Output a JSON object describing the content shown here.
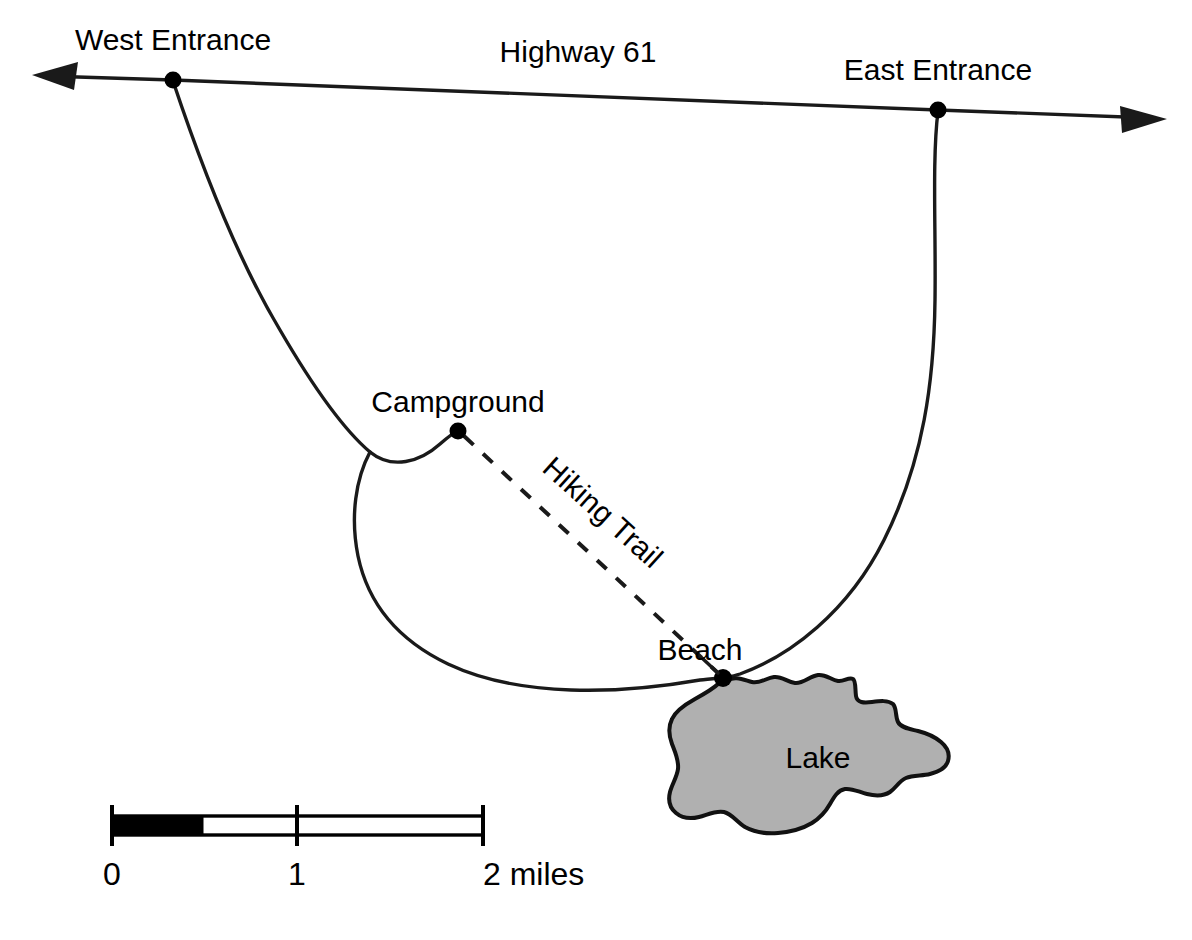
{
  "map": {
    "title": "Park Map",
    "background_color": "#ffffff",
    "ink_color": "#1a1a1a",
    "lake_fill_color": "#b0b0b0",
    "labels": {
      "west_entrance": "West Entrance",
      "east_entrance": "East Entrance",
      "highway": "Highway 61",
      "campground": "Campground",
      "hiking_trail": "Hiking Trail",
      "beach": "Beach",
      "lake": "Lake"
    },
    "features": [
      {
        "name": "West Entrance",
        "type": "junction",
        "x": 173,
        "y": 80
      },
      {
        "name": "East Entrance",
        "type": "junction",
        "x": 938,
        "y": 110
      },
      {
        "name": "Campground",
        "type": "point-of-interest",
        "x": 458,
        "y": 431
      },
      {
        "name": "Beach",
        "type": "point-of-interest",
        "x": 723,
        "y": 678
      },
      {
        "name": "Lake",
        "type": "water-body"
      },
      {
        "name": "Highway 61",
        "type": "highway"
      },
      {
        "name": "Hiking Trail",
        "type": "trail",
        "style": "dashed"
      }
    ],
    "scale_bar": {
      "units": "miles",
      "ticks": [
        "0",
        "1",
        "2 miles"
      ],
      "tick_values": [
        0,
        1,
        2
      ],
      "max": 2,
      "filled_to": 0.5
    }
  }
}
